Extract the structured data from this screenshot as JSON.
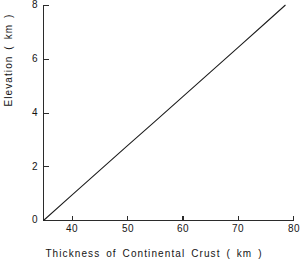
{
  "chart_data": {
    "type": "line",
    "title": "",
    "subtitle": "",
    "xlabel": "Thickness  of  Continental  Crust  ( km )",
    "ylabel": "Elevation  ( km )",
    "xlim": [
      35,
      80
    ],
    "ylim": [
      0,
      8
    ],
    "xticks": [
      40,
      50,
      60,
      70,
      80
    ],
    "xtick_labels": [
      "40",
      "50",
      "60",
      "70",
      "80"
    ],
    "yticks": [
      0,
      2,
      4,
      6,
      8
    ],
    "ytick_labels": [
      "0",
      "2",
      "4",
      "6",
      "8"
    ],
    "grid": false,
    "legend": null,
    "legend_position": "none",
    "annotations": [],
    "series": [
      {
        "name": "Elevation vs crustal thickness",
        "color": "#1b1b1b",
        "x": [
          35,
          40,
          45,
          50,
          55,
          60,
          65,
          70,
          75,
          78.5
        ],
        "y": [
          0,
          0.92,
          1.84,
          2.76,
          3.67,
          4.59,
          5.51,
          6.43,
          7.35,
          8.0
        ]
      }
    ]
  },
  "axis": {
    "x_tick_0_label": "40",
    "x_tick_1_label": "50",
    "x_tick_2_label": "60",
    "x_tick_3_label": "70",
    "x_tick_4_label": "80",
    "y_tick_0_label": "0",
    "y_tick_1_label": "2",
    "y_tick_2_label": "4",
    "y_tick_3_label": "6",
    "y_tick_4_label": "8"
  },
  "colors": {
    "background": "#ffffff",
    "axis": "#2b2b2b",
    "data_line": "#1b1b1b",
    "text": "#141414"
  }
}
